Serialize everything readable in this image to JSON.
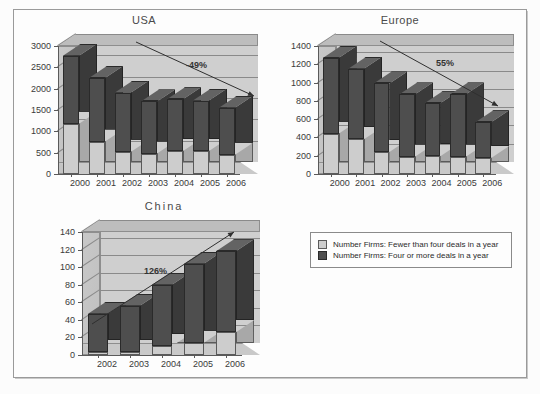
{
  "figure": {
    "border_color": "#9a9a9a",
    "background": "#fdfdfd"
  },
  "legend": {
    "items": [
      {
        "swatch": "light",
        "color": "#cdcdcd",
        "label": "Number Firms: Fewer than four deals in a year"
      },
      {
        "swatch": "dark",
        "color": "#4e4e4e",
        "label": "Number Firms: Four or more deals in a year"
      }
    ]
  },
  "chart_data": [
    {
      "type": "bar",
      "title": "USA",
      "xlabel": "",
      "ylabel": "",
      "ylim": [
        0,
        3000
      ],
      "yticks": [
        0,
        500,
        1000,
        1500,
        2000,
        2500,
        3000
      ],
      "ytick_labels": [
        "0",
        "500",
        "1000",
        "1500",
        "2000",
        "2500",
        "3000"
      ],
      "grid": true,
      "stacked": true,
      "categories": [
        "2000",
        "2001",
        "2002",
        "2003",
        "2004",
        "2005",
        "2006"
      ],
      "series": [
        {
          "name": "Number Firms: Fewer than four deals in a year",
          "color": "#cdcdcd",
          "values": [
            1180,
            760,
            520,
            480,
            540,
            540,
            450
          ]
        },
        {
          "name": "Number Firms: Four or more deals in a year",
          "color": "#4e4e4e",
          "values": [
            1590,
            1490,
            1390,
            1220,
            1210,
            1180,
            1100
          ]
        }
      ],
      "totals": [
        2770,
        2250,
        1910,
        1700,
        1750,
        1720,
        1550
      ],
      "annotation": {
        "text": "-49%",
        "arrow": "down-right"
      }
    },
    {
      "type": "bar",
      "title": "Europe",
      "xlabel": "",
      "ylabel": "",
      "ylim": [
        0,
        1400
      ],
      "yticks": [
        0,
        200,
        400,
        600,
        800,
        1000,
        1200,
        1400
      ],
      "ytick_labels": [
        "0",
        "200",
        "400",
        "600",
        "800",
        "1000",
        "1200",
        "1400"
      ],
      "grid": true,
      "stacked": true,
      "categories": [
        "2000",
        "2001",
        "2002",
        "2003",
        "2004",
        "2005",
        "2006"
      ],
      "series": [
        {
          "name": "Number Firms: Fewer than four deals in a year",
          "color": "#cdcdcd",
          "values": [
            440,
            380,
            240,
            190,
            195,
            190,
            175
          ]
        },
        {
          "name": "Number Firms: Four or more deals in a year",
          "color": "#4e4e4e",
          "values": [
            830,
            770,
            750,
            680,
            580,
            680,
            390
          ]
        }
      ],
      "totals": [
        1270,
        1150,
        990,
        870,
        775,
        870,
        565
      ],
      "annotation": {
        "text": "55%",
        "arrow": "down-right"
      }
    },
    {
      "type": "bar",
      "title": "China",
      "xlabel": "",
      "ylabel": "",
      "ylim": [
        0,
        140
      ],
      "yticks": [
        0,
        20,
        40,
        60,
        80,
        100,
        120,
        140
      ],
      "ytick_labels": [
        "0",
        "20",
        "40",
        "60",
        "80",
        "100",
        "120",
        "140"
      ],
      "grid": true,
      "stacked": true,
      "categories": [
        "2002",
        "2003",
        "2004",
        "2005",
        "2006"
      ],
      "series": [
        {
          "name": "Number Firms: Fewer than four deals in a year",
          "color": "#cdcdcd",
          "values": [
            3,
            3,
            10,
            14,
            26
          ]
        },
        {
          "name": "Number Firms: Four or more deals in a year",
          "color": "#4e4e4e",
          "values": [
            44,
            53,
            70,
            90,
            92
          ]
        }
      ],
      "totals": [
        47,
        56,
        80,
        104,
        118
      ],
      "annotation": {
        "text": "126%",
        "arrow": "up-right"
      }
    }
  ]
}
